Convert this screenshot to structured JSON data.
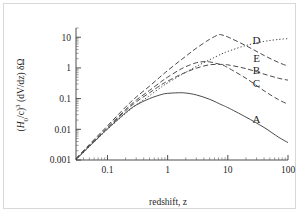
{
  "figure": {
    "background": "#ffffff",
    "border_color": "#d8d8d8",
    "ink_color": "#4a4a4a"
  },
  "axis": {
    "x_title": "redshift, z",
    "y_title_full": "(H0/c)3 (dV/dz) δΩ",
    "y_title_parts": {
      "open_paren": "(",
      "h_symbol": "H",
      "h_subscript": "0",
      "slash_c": "/c",
      "close_paren": ")",
      "power": "3",
      "dvdz": "(dV/dz)",
      "solid_angle": "δΩ"
    },
    "x_tick_labels": [
      "0.1",
      "1",
      "10",
      "100"
    ],
    "x_tick_values": [
      0.1,
      1,
      10,
      100
    ],
    "y_tick_labels": [
      "10",
      "1",
      "0.1",
      "0.01",
      "0.001"
    ],
    "y_tick_values": [
      10,
      1,
      0.1,
      0.01,
      0.001
    ]
  },
  "chart_data": {
    "type": "line",
    "title": "",
    "xlabel": "redshift, z",
    "ylabel": "(H0/c)3 (dV/dz) δΩ",
    "xscale": "log",
    "yscale": "log",
    "xlim": [
      0.03,
      100
    ],
    "ylim": [
      0.001,
      20
    ],
    "grid": false,
    "legend": "inline-curve-labels-right",
    "xticks": [
      0.1,
      1,
      10,
      100
    ],
    "yticks": [
      0.001,
      0.01,
      0.1,
      1,
      10
    ],
    "series": [
      {
        "name": "A",
        "label": "A",
        "linestyle": "solid",
        "peak_z": 2.0,
        "peak_value": 0.15,
        "x": [
          0.03,
          0.05,
          0.08,
          0.1,
          0.2,
          0.3,
          0.5,
          0.8,
          1.0,
          1.5,
          2.0,
          3.0,
          5.0,
          8.0,
          10.0,
          20.0,
          40.0,
          70.0,
          100.0
        ],
        "y": [
          0.00105,
          0.0028,
          0.0068,
          0.0103,
          0.0345,
          0.062,
          0.1,
          0.137,
          0.148,
          0.155,
          0.152,
          0.132,
          0.095,
          0.062,
          0.051,
          0.025,
          0.0115,
          0.0055,
          0.0037
        ]
      },
      {
        "name": "B",
        "label": "B",
        "linestyle": "dashed",
        "peak_z": 5.0,
        "peak_value": 1.3,
        "x": [
          0.03,
          0.05,
          0.08,
          0.1,
          0.2,
          0.3,
          0.5,
          0.8,
          1.0,
          1.5,
          2.0,
          3.0,
          5.0,
          8.0,
          10.0,
          20.0,
          40.0,
          70.0,
          100.0
        ],
        "y": [
          0.00105,
          0.0029,
          0.0072,
          0.011,
          0.04,
          0.078,
          0.155,
          0.29,
          0.37,
          0.56,
          0.72,
          0.98,
          1.27,
          1.3,
          1.26,
          0.95,
          0.63,
          0.46,
          0.4
        ]
      },
      {
        "name": "C",
        "label": "C",
        "linestyle": "dashed",
        "peak_z": 3.5,
        "peak_value": 1.6,
        "x": [
          0.03,
          0.05,
          0.08,
          0.1,
          0.2,
          0.3,
          0.5,
          0.8,
          1.0,
          1.5,
          2.0,
          3.0,
          4.0,
          5.0,
          8.0,
          10.0,
          20.0,
          40.0,
          70.0,
          100.0
        ],
        "y": [
          0.00108,
          0.003,
          0.0076,
          0.0118,
          0.044,
          0.089,
          0.185,
          0.37,
          0.5,
          0.82,
          1.1,
          1.48,
          1.6,
          1.57,
          1.25,
          1.02,
          0.46,
          0.18,
          0.092,
          0.066
        ]
      },
      {
        "name": "D",
        "label": "D",
        "linestyle": "dashed",
        "peak_z": 7.0,
        "peak_value": 12.0,
        "x": [
          0.03,
          0.05,
          0.08,
          0.1,
          0.2,
          0.3,
          0.5,
          0.8,
          1.0,
          1.5,
          2.0,
          3.0,
          5.0,
          7.0,
          8.0,
          10.0,
          20.0,
          40.0,
          70.0,
          100.0
        ],
        "y": [
          0.00112,
          0.0032,
          0.0083,
          0.013,
          0.053,
          0.112,
          0.255,
          0.57,
          0.82,
          1.55,
          2.4,
          4.4,
          8.6,
          12.0,
          11.8,
          10.2,
          5.3,
          2.55,
          1.5,
          1.15
        ]
      },
      {
        "name": "E",
        "label": "E",
        "linestyle": "dotted",
        "monotonic": true,
        "x": [
          0.03,
          0.05,
          0.08,
          0.1,
          0.2,
          0.3,
          0.5,
          0.8,
          1.0,
          1.5,
          2.0,
          3.0,
          5.0,
          8.0,
          10.0,
          20.0,
          40.0,
          70.0,
          100.0
        ],
        "y": [
          0.001,
          0.0027,
          0.0066,
          0.01,
          0.033,
          0.062,
          0.125,
          0.245,
          0.325,
          0.52,
          0.72,
          1.12,
          1.85,
          2.9,
          3.45,
          5.4,
          7.3,
          8.5,
          9.0
        ]
      }
    ],
    "curve_labels": [
      {
        "text": "D",
        "z": 30,
        "value": 6.0
      },
      {
        "text": "E",
        "z": 30,
        "value": 1.55
      },
      {
        "text": "B",
        "z": 30,
        "value": 0.62
      },
      {
        "text": "C",
        "z": 30,
        "value": 0.245
      },
      {
        "text": "A",
        "z": 30,
        "value": 0.0155
      }
    ]
  }
}
